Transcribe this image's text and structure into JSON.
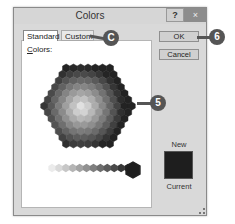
{
  "dialog": {
    "title": "Colors",
    "help_label": "?",
    "close_label": "×"
  },
  "tabs": [
    {
      "label": "Standard",
      "active": true
    },
    {
      "label": "Custom",
      "active": false
    }
  ],
  "panel": {
    "colors_label_underlined": "C",
    "colors_label_rest": "olors:",
    "selected_color": "#1e1e1e"
  },
  "buttons": {
    "ok": "OK",
    "cancel": "Cancel"
  },
  "preview": {
    "new_label": "New",
    "current_label": "Current",
    "color": "#1e1e1e"
  },
  "callouts": [
    {
      "label": "C",
      "target": "Custom tab"
    },
    {
      "label": "5",
      "target": "color hexagon"
    },
    {
      "label": "6",
      "target": "OK button"
    }
  ]
}
